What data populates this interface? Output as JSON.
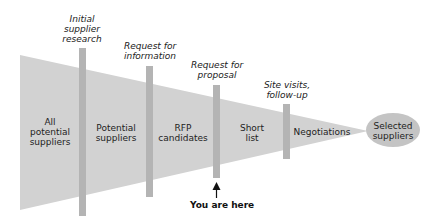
{
  "diagram": {
    "type": "funnel",
    "colors": {
      "funnel_fill": "#d2d2d2",
      "bar_fill": "#b4b4b4",
      "ellipse_fill": "#c4c4c4",
      "text": "#222222"
    },
    "milestones": [
      {
        "label_lines": [
          "Initial",
          "supplier",
          "research"
        ]
      },
      {
        "label_lines": [
          "Request for",
          "information"
        ]
      },
      {
        "label_lines": [
          "Request for",
          "proposal"
        ]
      },
      {
        "label_lines": [
          "Site visits,",
          "follow-up"
        ]
      }
    ],
    "stages": [
      {
        "label_lines": [
          "All",
          "potential",
          "suppliers"
        ]
      },
      {
        "label_lines": [
          "Potential",
          "suppliers"
        ]
      },
      {
        "label_lines": [
          "RFP",
          "candidates"
        ]
      },
      {
        "label_lines": [
          "Short",
          "list"
        ]
      },
      {
        "label_lines": [
          "Negotiations"
        ]
      }
    ],
    "endpoint": {
      "label_lines": [
        "Selected",
        "suppliers"
      ]
    },
    "marker": {
      "label": "You are here",
      "icon": "up-arrow-icon"
    }
  }
}
